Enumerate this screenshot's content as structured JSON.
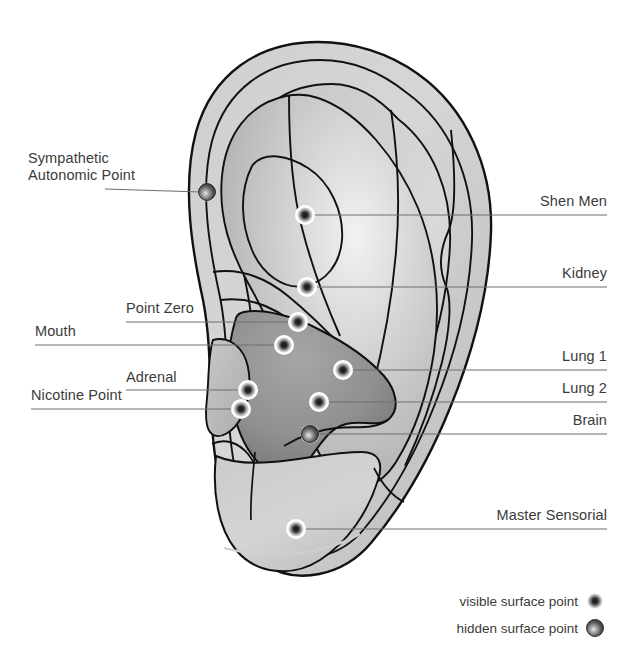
{
  "figure": {
    "background_color": "#ffffff",
    "text_color": "#3b3b3b",
    "leader_line_color": "#6e6e6e",
    "outline_color": "#111111",
    "ear_fill_light": "#d2d2d2",
    "ear_fill_mid": "#b4b4b4",
    "ear_fill_dark": "#8d8d8d"
  },
  "labels_left": [
    {
      "id": "sympathetic-autonomic-point",
      "line1": "Sympathetic",
      "line2": "Autonomic Point",
      "text_x": 28,
      "text_y": 150,
      "leader_from_x": 105,
      "leader_from_y": 189,
      "leader_to_x": 201,
      "leader_to_y": 192,
      "point_x": 207,
      "point_y": 192,
      "point_type": "hidden"
    },
    {
      "id": "point-zero",
      "line1": "Point Zero",
      "line2": "",
      "text_x": 126,
      "text_y": 300,
      "leader_from_x": 126,
      "leader_from_y": 322,
      "leader_to_x": 292,
      "leader_to_y": 322,
      "point_x": 298,
      "point_y": 322,
      "point_type": "visible"
    },
    {
      "id": "mouth",
      "line1": "Mouth",
      "line2": "",
      "text_x": 35,
      "text_y": 323,
      "leader_from_x": 35,
      "leader_from_y": 345,
      "leader_to_x": 278,
      "leader_to_y": 345,
      "point_x": 284,
      "point_y": 345,
      "point_type": "visible"
    },
    {
      "id": "adrenal",
      "line1": "Adrenal",
      "line2": "",
      "text_x": 126,
      "text_y": 369,
      "leader_from_x": 126,
      "leader_from_y": 390,
      "leader_to_x": 242,
      "leader_to_y": 390,
      "point_x": 248,
      "point_y": 390,
      "point_type": "visible"
    },
    {
      "id": "nicotine-point",
      "line1": "Nicotine Point",
      "line2": "",
      "text_x": 31,
      "text_y": 387,
      "leader_from_x": 31,
      "leader_from_y": 409,
      "leader_to_x": 235,
      "leader_to_y": 409,
      "point_x": 241,
      "point_y": 409,
      "point_type": "visible"
    }
  ],
  "labels_right": [
    {
      "id": "shen-men",
      "line1": "Shen Men",
      "text_x": 607,
      "text_y": 193,
      "leader_from_x": 607,
      "leader_from_y": 215,
      "leader_to_x": 311,
      "leader_to_y": 215,
      "point_x": 305,
      "point_y": 215,
      "point_type": "visible"
    },
    {
      "id": "kidney",
      "line1": "Kidney",
      "text_x": 607,
      "text_y": 265,
      "leader_from_x": 607,
      "leader_from_y": 287,
      "leader_to_x": 313,
      "leader_to_y": 287,
      "point_x": 307,
      "point_y": 287,
      "point_type": "visible"
    },
    {
      "id": "lung-1",
      "line1": "Lung 1",
      "text_x": 607,
      "text_y": 348,
      "leader_from_x": 607,
      "leader_from_y": 370,
      "leader_to_x": 349,
      "leader_to_y": 370,
      "point_x": 343,
      "point_y": 370,
      "point_type": "visible"
    },
    {
      "id": "lung-2",
      "line1": "Lung 2",
      "text_x": 607,
      "text_y": 380,
      "leader_from_x": 607,
      "leader_from_y": 402,
      "leader_to_x": 325,
      "leader_to_y": 402,
      "point_x": 319,
      "point_y": 402,
      "point_type": "visible"
    },
    {
      "id": "brain",
      "line1": "Brain",
      "text_x": 607,
      "text_y": 412,
      "leader_from_x": 607,
      "leader_from_y": 434,
      "leader_to_x": 318,
      "leader_to_y": 434,
      "point_x": 310,
      "point_y": 434,
      "point_type": "hidden"
    },
    {
      "id": "master-sensorial",
      "line1": "Master Sensorial",
      "text_x": 607,
      "text_y": 507,
      "leader_from_x": 607,
      "leader_from_y": 529,
      "leader_to_x": 302,
      "leader_to_y": 529,
      "point_x": 296,
      "point_y": 529,
      "point_type": "visible"
    }
  ],
  "legend": {
    "items": [
      {
        "id": "visible-surface-point",
        "label": "visible surface point",
        "text_x": 578,
        "text_y": 594,
        "marker_x": 595,
        "marker_y": 601,
        "type": "visible"
      },
      {
        "id": "hidden-surface-point",
        "label": "hidden surface point",
        "text_x": 578,
        "text_y": 621,
        "marker_x": 595,
        "marker_y": 628,
        "type": "hidden"
      }
    ]
  },
  "chart_data": {
    "type": "diagram",
    "point_count": 11,
    "marker_types": [
      "visible surface point",
      "hidden surface point"
    ],
    "points": [
      {
        "name": "Sympathetic Autonomic Point",
        "x": 207,
        "y": 192,
        "type": "hidden",
        "side": "left"
      },
      {
        "name": "Shen Men",
        "x": 305,
        "y": 215,
        "type": "visible",
        "side": "right"
      },
      {
        "name": "Kidney",
        "x": 307,
        "y": 287,
        "type": "visible",
        "side": "right"
      },
      {
        "name": "Point Zero",
        "x": 298,
        "y": 322,
        "type": "visible",
        "side": "left"
      },
      {
        "name": "Mouth",
        "x": 284,
        "y": 345,
        "type": "visible",
        "side": "left"
      },
      {
        "name": "Lung 1",
        "x": 343,
        "y": 370,
        "type": "visible",
        "side": "right"
      },
      {
        "name": "Adrenal",
        "x": 248,
        "y": 390,
        "type": "visible",
        "side": "left"
      },
      {
        "name": "Lung 2",
        "x": 319,
        "y": 402,
        "type": "visible",
        "side": "right"
      },
      {
        "name": "Nicotine Point",
        "x": 241,
        "y": 409,
        "type": "visible",
        "side": "left"
      },
      {
        "name": "Brain",
        "x": 310,
        "y": 434,
        "type": "hidden",
        "side": "right"
      },
      {
        "name": "Master Sensorial",
        "x": 296,
        "y": 529,
        "type": "visible",
        "side": "right"
      }
    ]
  }
}
